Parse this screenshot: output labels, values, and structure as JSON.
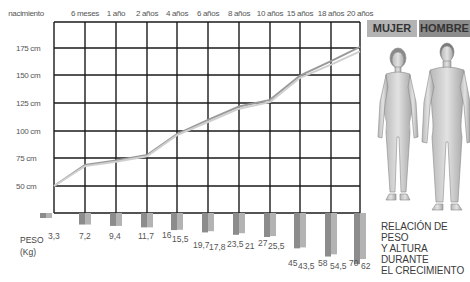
{
  "chart_data": {
    "type": "line",
    "title": "RELACIÓN DE PESO Y ALTURA DURANTE EL CRECIMIENTO",
    "categories": [
      "nacimiento",
      "6 meses",
      "1 año",
      "2 años",
      "4 años",
      "6 años",
      "8 años",
      "10 años",
      "15 años",
      "18 años",
      "20 años"
    ],
    "xlabel": "",
    "ylabel": "",
    "yticks": [
      "50 cm",
      "75 cm",
      "100 cm",
      "125 cm",
      "150 cm",
      "175 cm"
    ],
    "ylim": [
      45,
      190
    ],
    "grid": true,
    "legend": [
      "MUJER",
      "HOMBRE"
    ],
    "legend_position": "top-right",
    "height_series": [
      {
        "name": "MUJER",
        "values": [
          50,
          68,
          72,
          77,
          96,
          108,
          120,
          126,
          148,
          160,
          172
        ]
      },
      {
        "name": "HOMBRE",
        "values": [
          50,
          69,
          73,
          78,
          97,
          110,
          122,
          128,
          150,
          163,
          176
        ]
      }
    ],
    "weight_label": "PESO (Kg)",
    "weight_series": [
      {
        "name": "HOMBRE",
        "values": [
          3.3,
          7.2,
          9.4,
          11.7,
          16,
          19.7,
          23.5,
          27,
          45,
          58,
          70
        ]
      },
      {
        "name": "MUJER",
        "values": [
          3.3,
          7.2,
          9.4,
          11.7,
          15.5,
          17.8,
          21,
          25.5,
          43.5,
          54.5,
          62
        ]
      }
    ]
  },
  "axis": {
    "x_labels": [
      "nacimiento",
      "6 meses",
      "1 año",
      "2 años",
      "4 años",
      "6 años",
      "8 años",
      "10 años",
      "15 años",
      "18 años",
      "20 años"
    ],
    "y_labels": [
      "175 cm",
      "150 cm",
      "125 cm",
      "100 cm",
      "75 cm",
      "50 cm"
    ]
  },
  "legend": {
    "mujer": "MUJER",
    "hombre": "HOMBRE"
  },
  "peso": {
    "line1": "PESO",
    "line2": "(Kg)"
  },
  "weight_labels": [
    {
      "text": "3,3"
    },
    {
      "text": "7,2"
    },
    {
      "text": "9,4"
    },
    {
      "text": "11,7"
    },
    {
      "text": "16"
    },
    {
      "text": "15,5"
    },
    {
      "text": "19,7"
    },
    {
      "text": "17,8"
    },
    {
      "text": "23,5"
    },
    {
      "text": "21"
    },
    {
      "text": "27"
    },
    {
      "text": "25,5"
    },
    {
      "text": "45"
    },
    {
      "text": "43,5"
    },
    {
      "text": "58"
    },
    {
      "text": "54,5"
    },
    {
      "text": "70"
    },
    {
      "text": "62"
    }
  ],
  "title": {
    "line1": "RELACIÓN DE PESO",
    "line2": "Y ALTURA DURANTE",
    "line3": "EL CRECIMIENTO"
  },
  "colors": {
    "mujer": "#b3b3b3",
    "hombre": "#8c8c8c",
    "grid": "#1a1a1a",
    "line_mujer": "#c8c8c8",
    "line_hombre": "#9a9a9a"
  }
}
